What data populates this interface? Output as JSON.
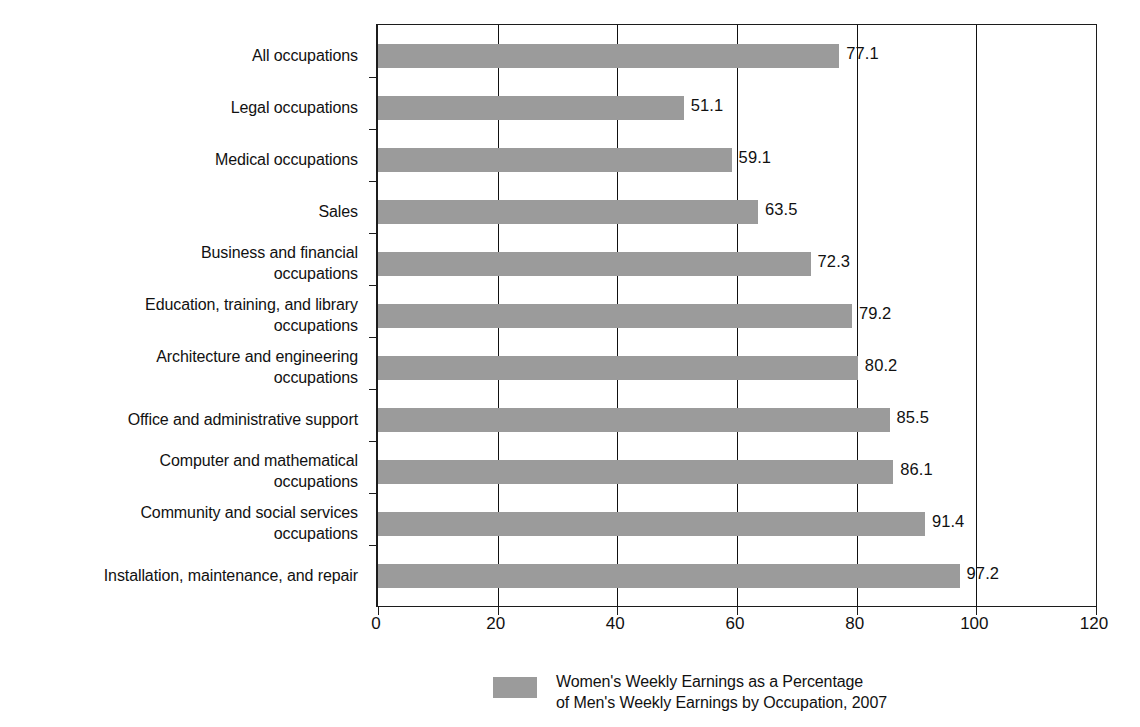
{
  "chart_data": {
    "type": "bar",
    "orientation": "horizontal",
    "title": "",
    "subtitle": "",
    "xlabel": "",
    "ylabel": "",
    "xlim": [
      0,
      120
    ],
    "xticks": [
      0,
      20,
      40,
      60,
      80,
      100,
      120
    ],
    "xtick_labels": [
      "0",
      "20",
      "40",
      "60",
      "80",
      "100",
      "120"
    ],
    "grid": true,
    "grid_axis": "x",
    "legend_position": "bottom",
    "bar_color": "#9b9b9b",
    "axis_color": "#1c1c1c",
    "categories": [
      "All occupations",
      "Legal occupations",
      "Medical occupations",
      "Sales",
      "Business and financial\noccupations",
      "Education, training, and library\noccupations",
      "Architecture and engineering\noccupations",
      "Office and administrative support",
      "Computer and mathematical\noccupations",
      "Community and social services\noccupations",
      "Installation, maintenance, and repair"
    ],
    "values": [
      77.1,
      51.1,
      59.1,
      63.5,
      72.3,
      79.2,
      80.2,
      85.5,
      86.1,
      91.4,
      97.2
    ],
    "value_labels": [
      "77.1",
      "51.1",
      "59.1",
      "63.5",
      "72.3",
      "79.2",
      "80.2",
      "85.5",
      "86.1",
      "91.4",
      "97.2"
    ],
    "series": [
      {
        "name": "Women's Weekly Earnings as a Percentage\nof Men's Weekly Earnings by Occupation, 2007",
        "values": [
          77.1,
          51.1,
          59.1,
          63.5,
          72.3,
          79.2,
          80.2,
          85.5,
          86.1,
          91.4,
          97.2
        ]
      }
    ],
    "legend": [
      {
        "label": "Women's Weekly Earnings as a Percentage\nof Men's Weekly Earnings by Occupation, 2007",
        "color": "#9b9b9b"
      }
    ]
  }
}
